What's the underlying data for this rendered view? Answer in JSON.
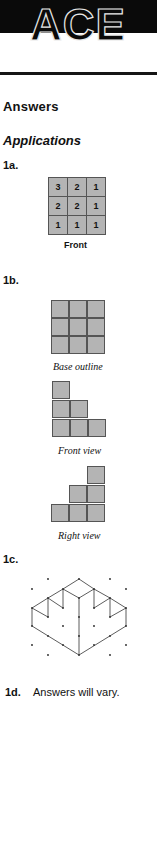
{
  "header": {
    "banner": "ACE"
  },
  "headings": {
    "answers": "Answers",
    "applications": "Applications"
  },
  "q1a": {
    "label": "1a.",
    "grid": [
      [
        "3",
        "2",
        "1"
      ],
      [
        "2",
        "2",
        "1"
      ],
      [
        "1",
        "1",
        "1"
      ]
    ],
    "caption": "Front"
  },
  "q1b": {
    "label": "1b.",
    "base_caption": "Base outline",
    "front_caption": "Front view",
    "right_caption": "Right view"
  },
  "q1c": {
    "label": "1c."
  },
  "q1d": {
    "label": "1d.",
    "text": "Answers will vary."
  },
  "colors": {
    "cell_fill": "#b4b4b4",
    "cell_border": "#555555",
    "band": "#0a0a0a"
  }
}
